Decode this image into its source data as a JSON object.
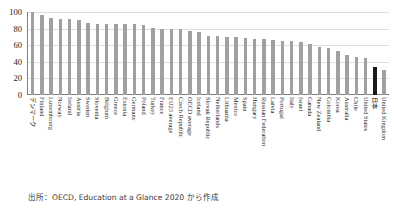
{
  "figure": {
    "top_strip_text": " ",
    "source_note": "出所：OECD, Education at a Glance 2020 から作成"
  },
  "chart_data": {
    "type": "bar",
    "title": "",
    "xlabel": "",
    "ylabel": "",
    "ylim": [
      0,
      100
    ],
    "yticks": [
      0,
      20,
      40,
      60,
      80,
      100
    ],
    "ytick_labels": [
      "0",
      "20",
      "40",
      "60",
      "80",
      "100"
    ],
    "grid": true,
    "legend": "none",
    "highlight_color": "#1a1a1a",
    "bar_color": "#a0a0a0",
    "highlight_category": "日本",
    "categories": [
      "デンマーク",
      "Finland",
      "Luxembourg",
      "Norway",
      "Ireland",
      "Austria",
      "Sweden",
      "Slovenia",
      "Belgium",
      "Greece",
      "Estonia",
      "Germany",
      "Poland",
      "Turkey",
      "France",
      "EU23 average",
      "Czech Republic",
      "OECD average",
      "Iceland",
      "Slovak Republic",
      "Netherlands",
      "Lithuania",
      "Mexico",
      "Spain",
      "Hungary",
      "Russian Federation",
      "Latvia",
      "Portugal",
      "Italy",
      "Israel",
      "Canada",
      "New Zealand",
      "Colombia",
      "Korea",
      "Australia",
      "Chile",
      "United States",
      "日本",
      "United Kingdom"
    ],
    "values": [
      100,
      96,
      93,
      92,
      92,
      90,
      87,
      86,
      85,
      85,
      85,
      85,
      84,
      81,
      80,
      80,
      79,
      77,
      76,
      71,
      71,
      70,
      70,
      69,
      68,
      67,
      66,
      65,
      65,
      64,
      61,
      58,
      57,
      53,
      48,
      46,
      44,
      34,
      30
    ]
  }
}
